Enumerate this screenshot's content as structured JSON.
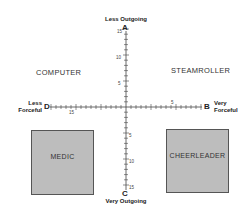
{
  "axes": {
    "top": {
      "pole": "A",
      "label": "Less Outgoing"
    },
    "bottom": {
      "pole": "C",
      "label": "Very Outgoing"
    },
    "left": {
      "pole": "D",
      "label_line1": "Less",
      "label_line2": "Forceful"
    },
    "right": {
      "pole": "B",
      "label_line1": "Very",
      "label_line2": "Forceful"
    }
  },
  "tick_labels": {
    "vertical_top": [
      "15",
      "10",
      "5"
    ],
    "vertical_bottom": [
      "5",
      "10",
      "15"
    ],
    "horizontal_left": [
      "15"
    ],
    "horizontal_right": [
      "5"
    ]
  },
  "quadrants": {
    "top_left": "COMPUTER",
    "top_right": "STEAMROLLER",
    "bottom_left": "MEDIC",
    "bottom_right": "CHEERLEADER"
  },
  "colors": {
    "box_fill": "#bdbdbd",
    "axis": "#444444"
  }
}
